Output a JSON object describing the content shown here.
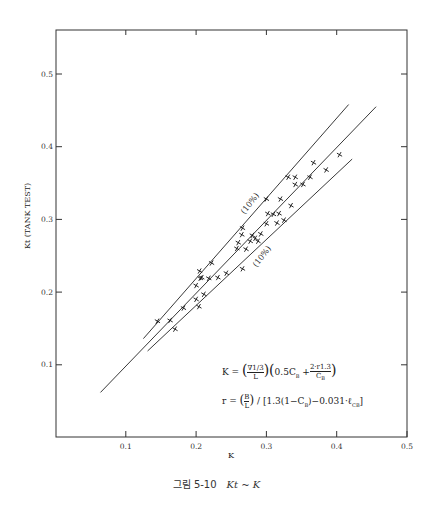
{
  "chart_data": {
    "type": "scatter",
    "title": "",
    "xlabel": "K",
    "ylabel": "Kt (TANK TEST)",
    "xlim": [
      0.0,
      0.5
    ],
    "ylim": [
      0.0,
      0.56
    ],
    "x_ticks": [
      0.1,
      0.2,
      0.3,
      0.4,
      0.5
    ],
    "y_ticks": [
      0.1,
      0.2,
      0.3,
      0.4,
      0.5
    ],
    "x_tick_labels": [
      "0.1",
      "0.2",
      "0.3",
      "0.4",
      "0.5"
    ],
    "y_tick_labels": [
      "0.1",
      "0.2",
      "0.3",
      "0.4",
      "0.5"
    ],
    "grid": false,
    "marker": "x",
    "series": [
      {
        "name": "Tank test data",
        "points": [
          [
            0.145,
            0.16
          ],
          [
            0.163,
            0.161
          ],
          [
            0.17,
            0.149
          ],
          [
            0.182,
            0.178
          ],
          [
            0.2,
            0.19
          ],
          [
            0.204,
            0.18
          ],
          [
            0.211,
            0.197
          ],
          [
            0.2,
            0.209
          ],
          [
            0.206,
            0.219
          ],
          [
            0.205,
            0.229
          ],
          [
            0.208,
            0.22
          ],
          [
            0.218,
            0.219
          ],
          [
            0.222,
            0.24
          ],
          [
            0.231,
            0.22
          ],
          [
            0.243,
            0.226
          ],
          [
            0.258,
            0.26
          ],
          [
            0.26,
            0.268
          ],
          [
            0.265,
            0.279
          ],
          [
            0.266,
            0.288
          ],
          [
            0.271,
            0.259
          ],
          [
            0.266,
            0.232
          ],
          [
            0.277,
            0.27
          ],
          [
            0.28,
            0.278
          ],
          [
            0.284,
            0.274
          ],
          [
            0.292,
            0.28
          ],
          [
            0.3,
            0.294
          ],
          [
            0.302,
            0.308
          ],
          [
            0.3,
            0.328
          ],
          [
            0.31,
            0.307
          ],
          [
            0.315,
            0.295
          ],
          [
            0.318,
            0.308
          ],
          [
            0.32,
            0.328
          ],
          [
            0.288,
            0.27
          ],
          [
            0.325,
            0.299
          ],
          [
            0.331,
            0.358
          ],
          [
            0.341,
            0.358
          ],
          [
            0.341,
            0.348
          ],
          [
            0.335,
            0.319
          ],
          [
            0.352,
            0.348
          ],
          [
            0.362,
            0.358
          ],
          [
            0.367,
            0.378
          ],
          [
            0.385,
            0.368
          ],
          [
            0.404,
            0.389
          ]
        ]
      }
    ],
    "lines": [
      {
        "name": "Mean line",
        "from": [
          0.064,
          0.062
        ],
        "to": [
          0.456,
          0.455
        ]
      },
      {
        "name": "+10% line",
        "label": "(10%)",
        "from": [
          0.125,
          0.136
        ],
        "to": [
          0.417,
          0.458
        ]
      },
      {
        "name": "-10% line",
        "label": "(10%)",
        "from": [
          0.131,
          0.119
        ],
        "to": [
          0.422,
          0.383
        ]
      }
    ],
    "annotations": [
      "K = (∇^(1/3) / L)(0.5C_B + 2·r^1.3 / C_B)",
      "r = (B/L) / [1.3(1 − C_B) − 0.031·ℓ_CB]"
    ]
  },
  "labels": {
    "band_upper": "(10%)",
    "band_lower": "(10%)",
    "x_axis_title": "K",
    "y_axis_title": "Kt (TANK TEST)"
  },
  "formula": {
    "k_lhs": "K =",
    "k_frac1_num": "∇1/3",
    "k_frac1_den": "L",
    "k_term": "0.5C",
    "k_sub": "B",
    "k_plus": "+",
    "k_frac2_num": "2·r1.3",
    "k_frac2_den": "C",
    "r_lhs": "r =",
    "r_frac_num": "B",
    "r_frac_den": "L",
    "r_rest": "/ [1.3(1−C",
    "r_rest2": ")−0.031·ℓ",
    "r_sub2": "CB",
    "r_close": "]"
  },
  "caption": {
    "prefix": "그림 5-10",
    "math": "Kt ~ K"
  }
}
